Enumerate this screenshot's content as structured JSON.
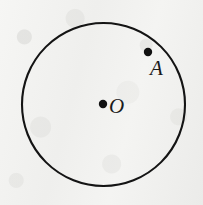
{
  "figure": {
    "background_color": "#f3f3f1",
    "ink_color": "#141414",
    "canvas": {
      "width": 203,
      "height": 205
    }
  },
  "circle": {
    "name": "circle-outline",
    "center_x": 103.5,
    "center_y": 104.5,
    "radius": 81.5,
    "stroke_width": 2.1,
    "stroke_color": "#141414",
    "fill": "none"
  },
  "points": [
    {
      "id": "O",
      "label": "O",
      "role": "center",
      "x": 103,
      "y": 104,
      "dot_radius": 4.2,
      "dot_color": "#111111",
      "label_x": 109,
      "label_y": 96,
      "label_font_size": 21,
      "label_style": "italic-serif"
    },
    {
      "id": "A",
      "label": "A",
      "role": "interior-point",
      "x": 148,
      "y": 52,
      "dot_radius": 4.2,
      "dot_color": "#111111",
      "label_x": 150,
      "label_y": 58,
      "label_font_size": 21,
      "label_style": "italic-serif"
    }
  ]
}
